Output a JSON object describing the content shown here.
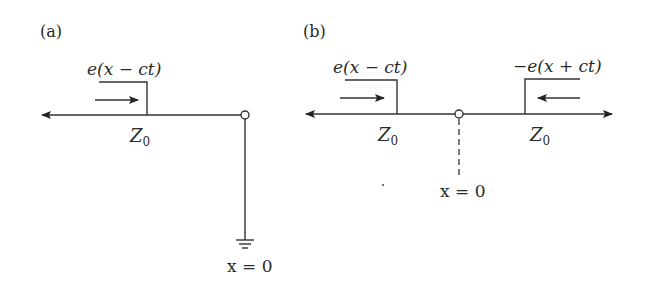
{
  "figure": {
    "panel_a": {
      "label": "(a)",
      "pulse_label": "e(x − ct)",
      "impedance_label": "Z",
      "impedance_subscript": "0",
      "position_label": "x = 0",
      "termination": "ground",
      "pulse_direction": "right"
    },
    "panel_b": {
      "label": "(b)",
      "incident_pulse_label": "e(x − ct)",
      "reflected_pulse_label": "−e(x + ct)",
      "left_impedance_label": "Z",
      "left_impedance_subscript": "0",
      "right_impedance_label": "Z",
      "right_impedance_subscript": "0",
      "position_label": "x = 0",
      "incident_direction": "right",
      "reflected_direction": "left"
    },
    "colors": {
      "line": "#333333",
      "text": "#2a2a2a",
      "background": "#ffffff"
    }
  }
}
